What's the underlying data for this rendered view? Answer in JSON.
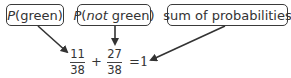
{
  "labels": {
    "p_green": {
      "prefix": "P",
      "text": "(green)"
    },
    "p_not_green": {
      "prefix": "P",
      "paren_open": "(",
      "italic": "not",
      "rest": " green)"
    },
    "sum": {
      "text": "sum of probabilities"
    }
  },
  "equation": {
    "term1": {
      "numerator": "11",
      "denominator": "38"
    },
    "operator": "+",
    "term2": {
      "numerator": "27",
      "denominator": "38"
    },
    "equals": "=",
    "result": "1"
  }
}
